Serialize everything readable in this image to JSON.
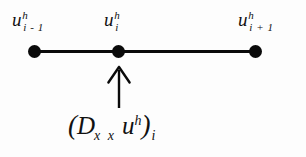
{
  "figure": {
    "background_color": "#fdfdfd",
    "ink_color": "#0a0a0a"
  },
  "stencil": {
    "nodes": [
      {
        "id": "left",
        "label_base": "u",
        "label_superscript": "h",
        "label_subscript": "i - 1"
      },
      {
        "id": "center",
        "label_base": "u",
        "label_superscript": "h",
        "label_subscript": "i"
      },
      {
        "id": "right",
        "label_base": "u",
        "label_superscript": "h",
        "label_subscript": "i + 1"
      }
    ]
  },
  "annotation": {
    "arrow_direction": "up",
    "formula": {
      "open_paren": "(",
      "operator": "D",
      "operator_subscript": "x x",
      "function": "u",
      "function_superscript": "h",
      "close_paren": ")",
      "close_subscript": "i"
    }
  }
}
